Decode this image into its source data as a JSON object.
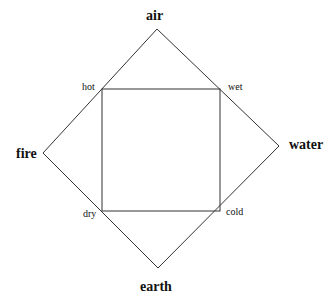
{
  "diagram": {
    "elements": {
      "top": "air",
      "left": "fire",
      "right": "water",
      "bottom": "earth"
    },
    "qualities": {
      "top_left": "hot",
      "top_right": "wet",
      "bottom_left": "dry",
      "bottom_right": "cold"
    },
    "colors": {
      "line": "#333333",
      "text": "#111111",
      "background": "#ffffff"
    }
  }
}
